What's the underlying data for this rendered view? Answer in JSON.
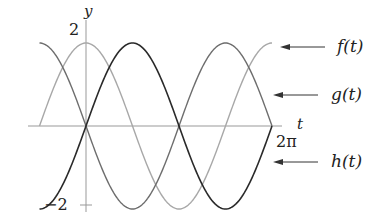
{
  "chart_data": {
    "type": "line",
    "title": "",
    "xlabel": "t",
    "ylabel": "y",
    "xlim": [
      -1.5708,
      6.2832
    ],
    "ylim": [
      -2,
      2
    ],
    "grid": false,
    "tick_labels": {
      "x": [
        {
          "value": 6.2832,
          "label": "2π"
        }
      ],
      "y": [
        {
          "value": 2,
          "label": "2"
        },
        {
          "value": -2,
          "label": "−2"
        }
      ]
    },
    "series": [
      {
        "name": "f(t)",
        "formula": "2cos(t)",
        "color": "#a8a8a8",
        "amplitude": 2,
        "phase": "cos",
        "t_start": -1.5708,
        "t_end": 6.2832
      },
      {
        "name": "g(t)",
        "formula": "-2sin(t)",
        "color": "#6e6e6e",
        "amplitude": -2,
        "phase": "sin",
        "t_start": -1.5708,
        "t_end": 6.2832
      },
      {
        "name": "h(t)",
        "formula": "2sin(t)",
        "color": "#2a2a2a",
        "amplitude": 2,
        "phase": "sin",
        "t_start": -1.5708,
        "t_end": 6.2832
      }
    ],
    "legend": {
      "position": "right",
      "style": "arrow-annotations"
    },
    "annotations": [
      {
        "text": "f(t)",
        "points_to_y": 2
      },
      {
        "text": "g(t)",
        "arrow_y_px": 95
      },
      {
        "text": "h(t)",
        "arrow_y_px": 162
      }
    ]
  },
  "labels": {
    "y_axis": "y",
    "t_axis": "t",
    "y_max": "2",
    "y_min": "−2",
    "x_max": "2π",
    "f": "f(t)",
    "g": "g(t)",
    "h": "h(t)"
  }
}
